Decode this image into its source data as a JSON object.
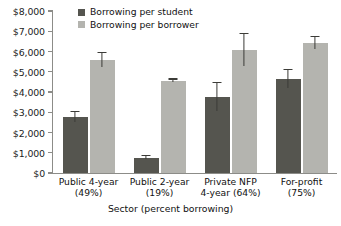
{
  "chart_data": {
    "type": "bar",
    "title": "",
    "subtitle": "",
    "xlabel": "Sector (percent borrowing)",
    "ylabel": "",
    "ylim": [
      0,
      8000
    ],
    "ytick_step": 1000,
    "ytick_labels": [
      "$8,000",
      "$7,000",
      "$6,000",
      "$5,000",
      "$4,000",
      "$3,000",
      "$2,000",
      "$1,000",
      "$0"
    ],
    "ytick_values": [
      8000,
      7000,
      6000,
      5000,
      4000,
      3000,
      2000,
      1000,
      0
    ],
    "grid": false,
    "legend_position": "top-left-inside",
    "categories": [
      "Public 4-year\n(49%)",
      "Public 2-year\n(19%)",
      "Private NFP\n4-year (64%)",
      "For-profit\n(75%)"
    ],
    "category_names": [
      "Public 4-year",
      "Public 2-year",
      "Private NFP 4-year",
      "For-profit"
    ],
    "category_percent_borrowing": [
      "49%",
      "19%",
      "64%",
      "75%"
    ],
    "series": [
      {
        "name": "Borrowing per student",
        "color": "#55554f",
        "values": [
          2750,
          750,
          3750,
          4650
        ],
        "errors": [
          250,
          80,
          700,
          450
        ]
      },
      {
        "name": "Borrowing per borrower",
        "color": "#b4b4af",
        "values": [
          5580,
          4550,
          6070,
          6420
        ],
        "errors": [
          350,
          60,
          800,
          300
        ]
      }
    ]
  },
  "axes": {
    "y_axis_name": "y-axis",
    "x_axis_name": "x-axis"
  },
  "colors": {
    "series_dark": "#55554f",
    "series_light": "#b4b4af",
    "axis": "#8c8c88",
    "error_bar": "#3c3c38",
    "background": "#ffffff",
    "text": "#111111"
  }
}
